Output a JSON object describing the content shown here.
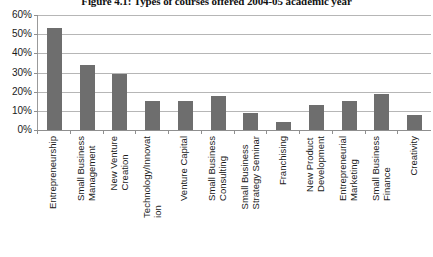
{
  "chart_data": {
    "type": "bar",
    "title": "Figure 4.1: Types of courses offered 2004-05 academic year",
    "xlabel": "",
    "ylabel": "",
    "ylim": [
      0,
      60
    ],
    "ytick_labels": [
      "60%",
      "50%",
      "40%",
      "30%",
      "20%",
      "10%",
      "0%"
    ],
    "ytick_values": [
      60,
      50,
      40,
      30,
      20,
      10,
      0
    ],
    "grid": true,
    "legend": "none",
    "bar_color": "#6e6e6e",
    "gridline_color": "#b6b6b6",
    "axis_color": "#8f8f8f",
    "categories": [
      "Entrepreneurship",
      "Small Business Management",
      "New Venture Creation",
      "Technology/Innovation",
      "Venture Capital",
      "Small Business Consulting",
      "Small Business Strategy Seminar",
      "Franchising",
      "New Product Development",
      "Entrepreneurial Marketing",
      "Small Business Finance",
      "Creativity"
    ],
    "category_lines": [
      [
        "Entrepreneurship",
        ""
      ],
      [
        "Small Business",
        "Management"
      ],
      [
        "New Venture",
        "Creation"
      ],
      [
        "Technology/Innovat",
        "ion"
      ],
      [
        "Venture Capital",
        ""
      ],
      [
        "Small Business",
        "Consulting"
      ],
      [
        "Small Business",
        "Strategy Seminar"
      ],
      [
        "Franchising",
        ""
      ],
      [
        "New Product",
        "Development"
      ],
      [
        "Entrepreneurial",
        "Marketing"
      ],
      [
        "Small Business",
        "Finance"
      ],
      [
        "Creativity",
        ""
      ]
    ],
    "values": [
      53,
      34,
      29,
      15,
      15,
      18,
      9,
      4,
      13,
      15,
      19,
      8
    ],
    "value_labels": [
      "53%",
      "34%",
      "29%",
      "15%",
      "15%",
      "18%",
      "9%",
      "4%",
      "13%",
      "15%",
      "19%",
      "8%"
    ]
  }
}
